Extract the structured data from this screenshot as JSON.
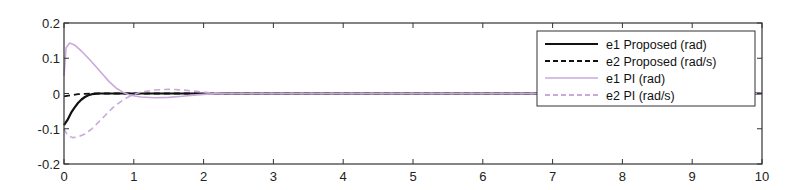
{
  "chart_data": {
    "type": "line",
    "title": "",
    "xlabel": "",
    "ylabel": "",
    "xlim": [
      0,
      10
    ],
    "ylim": [
      -0.2,
      0.2
    ],
    "grid": false,
    "legend_position": "upper right",
    "x_ticks": [
      0,
      1,
      2,
      3,
      4,
      5,
      6,
      7,
      8,
      9,
      10
    ],
    "x_tick_labels": [
      "0",
      "1",
      "2",
      "3",
      "4",
      "5",
      "6",
      "7",
      "8",
      "9",
      "10"
    ],
    "y_ticks": [
      0.2,
      0.1,
      0,
      -0.1,
      -0.2
    ],
    "y_tick_labels": [
      "0.2",
      "0.1",
      "0",
      "-0.1",
      "-0.2"
    ],
    "series": [
      {
        "name": "e1 Proposed (rad)",
        "color": "#111111",
        "style": "solid",
        "width": 2.2,
        "x": [
          0,
          0.05,
          0.1,
          0.15,
          0.2,
          0.25,
          0.3,
          0.35,
          0.4,
          0.5,
          0.7,
          1,
          2,
          4,
          6,
          8,
          10
        ],
        "y": [
          -0.09,
          -0.075,
          -0.055,
          -0.04,
          -0.027,
          -0.017,
          -0.01,
          -0.005,
          -0.002,
          0,
          0,
          0,
          0,
          0,
          0,
          0,
          0
        ]
      },
      {
        "name": "e2 Proposed  (rad/s)",
        "color": "#111111",
        "style": "dashed",
        "width": 1.8,
        "x": [
          0,
          0.1,
          0.2,
          0.3,
          0.4,
          0.6,
          1,
          2,
          4,
          6,
          8,
          10
        ],
        "y": [
          -0.008,
          -0.005,
          -0.002,
          -0.001,
          0,
          0,
          0,
          0,
          0,
          0,
          0,
          0
        ]
      },
      {
        "name": "e1 PI  (rad)",
        "color": "#c9a9dc",
        "style": "solid",
        "width": 1.6,
        "x": [
          0,
          0.03,
          0.08,
          0.15,
          0.25,
          0.35,
          0.45,
          0.55,
          0.65,
          0.75,
          0.85,
          0.95,
          1.1,
          1.3,
          1.5,
          1.7,
          1.9,
          2.1,
          2.4,
          3,
          4,
          6,
          8,
          10
        ],
        "y": [
          0.05,
          0.13,
          0.143,
          0.138,
          0.12,
          0.1,
          0.078,
          0.055,
          0.033,
          0.015,
          0.003,
          -0.005,
          -0.01,
          -0.012,
          -0.011,
          -0.008,
          -0.004,
          -0.001,
          0,
          0,
          0,
          0,
          0,
          0
        ]
      },
      {
        "name": "e2 PI  (rad/s)",
        "color": "#c9a9dc",
        "style": "dashed",
        "width": 1.6,
        "x": [
          0,
          0.05,
          0.12,
          0.2,
          0.3,
          0.4,
          0.5,
          0.6,
          0.7,
          0.8,
          0.9,
          1.0,
          1.1,
          1.3,
          1.5,
          1.7,
          1.9,
          2.1,
          2.4,
          3,
          4,
          6,
          8,
          10
        ],
        "y": [
          -0.1,
          -0.118,
          -0.125,
          -0.123,
          -0.115,
          -0.1,
          -0.08,
          -0.06,
          -0.04,
          -0.025,
          -0.012,
          -0.003,
          0.004,
          0.01,
          0.012,
          0.01,
          0.006,
          0.002,
          0,
          0,
          0,
          0,
          0,
          0
        ]
      }
    ]
  }
}
